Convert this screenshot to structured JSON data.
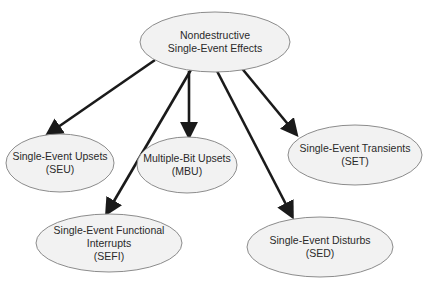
{
  "diagram": {
    "root": {
      "id": "nondestructive-see",
      "lines": [
        "Nondestructive",
        "Single-Event Effects"
      ],
      "cx": 215,
      "cy": 42,
      "rx": 75,
      "ry": 30
    },
    "children": [
      {
        "id": "seu",
        "lines": [
          "Single-Event Upsets",
          "(SEU)"
        ],
        "cx": 60,
        "cy": 163,
        "rx": 54,
        "ry": 29
      },
      {
        "id": "mbu",
        "lines": [
          "Multiple-Bit Upsets",
          "(MBU)"
        ],
        "cx": 187,
        "cy": 165,
        "rx": 50,
        "ry": 28
      },
      {
        "id": "set",
        "lines": [
          "Single-Event Transients",
          "(SET)"
        ],
        "cx": 355,
        "cy": 155,
        "rx": 67,
        "ry": 30
      },
      {
        "id": "sefi",
        "lines": [
          "Single-Event Functional",
          "Interrupts",
          "(SEFI)"
        ],
        "cx": 109,
        "cy": 243,
        "rx": 73,
        "ry": 29
      },
      {
        "id": "sed",
        "lines": [
          "Single-Event Disturbs",
          "(SED)"
        ],
        "cx": 320,
        "cy": 247,
        "rx": 73,
        "ry": 30
      }
    ],
    "edges": [
      {
        "from": "nondestructive-see",
        "to": "seu",
        "x1": 155,
        "y1": 60,
        "x2": 48,
        "y2": 134
      },
      {
        "from": "nondestructive-see",
        "to": "sefi",
        "x1": 192,
        "y1": 68,
        "x2": 107,
        "y2": 213
      },
      {
        "from": "nondestructive-see",
        "to": "mbu",
        "x1": 189,
        "y1": 71,
        "x2": 189,
        "y2": 136
      },
      {
        "from": "nondestructive-see",
        "to": "sed",
        "x1": 217,
        "y1": 71,
        "x2": 292,
        "y2": 216
      },
      {
        "from": "nondestructive-see",
        "to": "set",
        "x1": 235,
        "y1": 60,
        "x2": 296,
        "y2": 134
      }
    ],
    "colors": {
      "ellipse_fill": "#f2f2f2",
      "ellipse_stroke": "#8c8c8c",
      "arrow": "#1a1a1a",
      "text": "#2a2a2a"
    }
  }
}
